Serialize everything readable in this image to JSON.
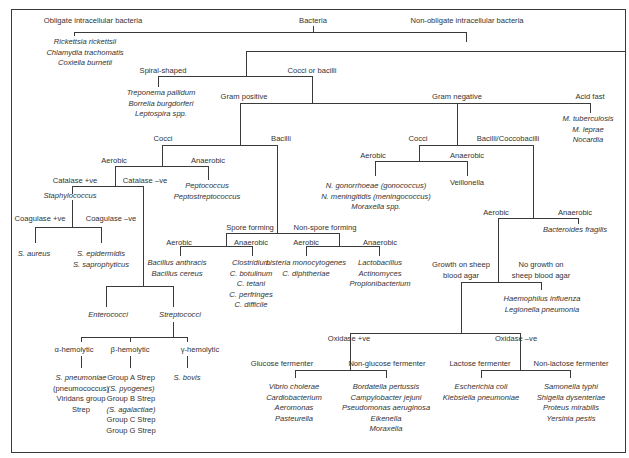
{
  "diagram": {
    "title": "Bacteria",
    "nodes": {
      "obligate": "Obligate intracellular bacteria",
      "non_obligate": "Non-obligate intracellular bacteria",
      "obligate_examples": [
        "Rickettsia rickettsii",
        "Chlamydia trachomatis",
        "Coxiella burnetii"
      ],
      "spiral": "Spiral-shaped",
      "spiral_examples": [
        "Treponema pallidum",
        "Borrelia burgdorferi",
        "Leptospira spp."
      ],
      "cocci_or_bacilli": "Cocci or bacilli",
      "acid_fast": "Acid fast",
      "acid_fast_examples": [
        "M. tuberculosis",
        "M. leprae",
        "Nocardia"
      ],
      "gram_positive": "Gram positive",
      "gram_negative": "Gram negative",
      "gp_cocci": "Cocci",
      "gp_bacilli": "Bacilli",
      "gp_cocci_aerobic": "Aerobic",
      "gp_cocci_anaerobic": "Anaerobic",
      "gp_cocci_anaerobic_examples": [
        "Peptococcus",
        "Peptostreptococcus"
      ],
      "catalase_pos": "Catalase +ve",
      "catalase_neg": "Catalase –ve",
      "staphylococcus": "Staphylococcus",
      "coagulase_pos": "Coagulase +ve",
      "coagulase_neg": "Coagulase –ve",
      "coagulase_pos_examples": [
        "S. aureus"
      ],
      "coagulase_neg_examples": [
        "S. epidermidis",
        "S. saprophyticus"
      ],
      "enterococci": "Enterococci",
      "streptococci": "Streptococci",
      "alpha": "α-hemolytic",
      "beta": "β-hemolytic",
      "gamma": "γ-hemolytic",
      "alpha_examples": [
        "S. pneumoniae",
        "(pneumococcus)",
        "Viridans group",
        "Strep"
      ],
      "beta_examples": [
        "Group A Strep",
        "(S. pyogenes)",
        "Group B Strep",
        "(S. agalactiae)",
        "Group C Strep",
        "Group G Strep"
      ],
      "gamma_examples": [
        "S. bovis"
      ],
      "spore_forming": "Spore forming",
      "non_spore_forming": "Non-spore forming",
      "sf_aerobic": "Aerobic",
      "sf_anaerobic": "Anaerobic",
      "sf_aerobic_examples": [
        "Bacillus anthracis",
        "Bacillus cereus"
      ],
      "sf_anaerobic_examples": [
        "Clostridium",
        "C. botulinum",
        "C. tetani",
        "C. perfringes",
        "C. difficile"
      ],
      "nsf_aerobic": "Aerobic",
      "nsf_anaerobic": "Anaerobic",
      "nsf_aerobic_examples": [
        "Listeria monocytogenes",
        "C. diphtheriae"
      ],
      "nsf_anaerobic_examples": [
        "Lactobacillus",
        "Actinomyces",
        "Propionibacterium"
      ],
      "gn_cocci": "Cocci",
      "gn_bacilli": "Bacilli/Coccobacilli",
      "gn_cocci_aerobic": "Aerobic",
      "gn_cocci_anaerobic": "Anaerobic",
      "gn_cocci_aerobic_examples": [
        "N. gonorrhoeae (gonococcus)",
        "N. meningitidis (meningococcus)",
        "Moraxella spp."
      ],
      "gn_cocci_anaerobic_examples": [
        "Veillonella"
      ],
      "gn_bacilli_aerobic": "Aerobic",
      "gn_bacilli_anaerobic": "Anaerobic",
      "gn_bacilli_anaerobic_examples": [
        "Bacteroides fragilis"
      ],
      "growth_sheep": [
        "Growth on sheep",
        "blood agar"
      ],
      "no_growth_sheep": [
        "No growth on",
        "sheep blood agar"
      ],
      "no_growth_examples": [
        "Haemophilus influenza",
        "Legionella pneumonia"
      ],
      "oxidase_pos": "Oxidase +ve",
      "oxidase_neg": "Oxidase –ve",
      "glucose_fermenter": "Glucose fermenter",
      "non_glucose_fermenter": "Non-glucose fermenter",
      "glucose_examples": [
        "Vibrio cholerae",
        "Cardiobacterium",
        "Aeromonas",
        "Pasteurella"
      ],
      "non_glucose_examples": [
        "Bordatella pertussis",
        "Campylobacter jejuni",
        "Pseudomonas aeruginosa",
        "Eikenella",
        "Moraxella"
      ],
      "lactose_fermenter": "Lactose fermenter",
      "non_lactose_fermenter": "Non-lactose fermenter",
      "lactose_examples": [
        "Escherichia coli",
        "Klebsiella pneumoniae"
      ],
      "non_lactose_examples": [
        "Samonella typhi",
        "Shigella dysenteriae",
        "Proteus mirabilis",
        "Yersinia pestis"
      ]
    },
    "colors": {
      "line": "#3a3a3a",
      "text": "#333333",
      "background": "#ffffff"
    }
  }
}
